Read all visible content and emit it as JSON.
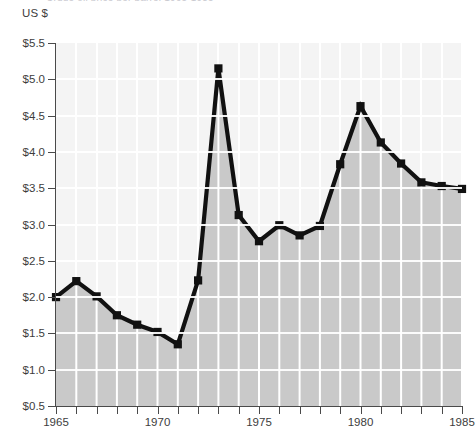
{
  "title_sliver": "Crude oil price per barrel 1965-1985",
  "unit_label": "US $",
  "chart_data": {
    "type": "area",
    "title": "",
    "xlabel": "",
    "ylabel": "US $",
    "categories": [
      "1965",
      "1966",
      "1967",
      "1968",
      "1969",
      "1970",
      "1971",
      "1972",
      "1973",
      "1974",
      "1975",
      "1976",
      "1977",
      "1978",
      "1979",
      "1980",
      "1981",
      "1982",
      "1983",
      "1984",
      "1985"
    ],
    "values": [
      2.0,
      2.22,
      2.01,
      1.75,
      1.62,
      1.52,
      1.35,
      2.23,
      5.15,
      3.13,
      2.77,
      2.99,
      2.85,
      2.98,
      3.83,
      4.63,
      4.13,
      3.84,
      3.58,
      3.53,
      3.49
    ],
    "x": [
      1965,
      1966,
      1967,
      1968,
      1969,
      1970,
      1971,
      1972,
      1973,
      1974,
      1975,
      1976,
      1977,
      1978,
      1979,
      1980,
      1981,
      1982,
      1983,
      1984,
      1985
    ],
    "xlim": [
      1965,
      1985
    ],
    "ylim": [
      0.5,
      5.5
    ],
    "ytick_labels": [
      "$5.5",
      "$5.0",
      "$4.5",
      "$4.0",
      "$3.5",
      "$3.0",
      "$2.5",
      "$2.0",
      "$1.5",
      "$1.0",
      "$0.5"
    ],
    "ytick_values": [
      5.5,
      5.0,
      4.5,
      4.0,
      3.5,
      3.0,
      2.5,
      2.0,
      1.5,
      1.0,
      0.5
    ],
    "xtick_labels": [
      "1965",
      "1970",
      "1975",
      "1980",
      "1985"
    ],
    "xtick_values": [
      1965,
      1970,
      1975,
      1980,
      1985
    ],
    "grid": "horizontal-and-vertical-white",
    "legend": "none",
    "colors": {
      "area_fill": "#c9c9c9",
      "line": "#111111",
      "marker": "#111111",
      "plot_background": "#f4f4f4",
      "gridline": "#ffffff",
      "axis": "#4a4a4a",
      "text": "#3d3d3d"
    }
  }
}
